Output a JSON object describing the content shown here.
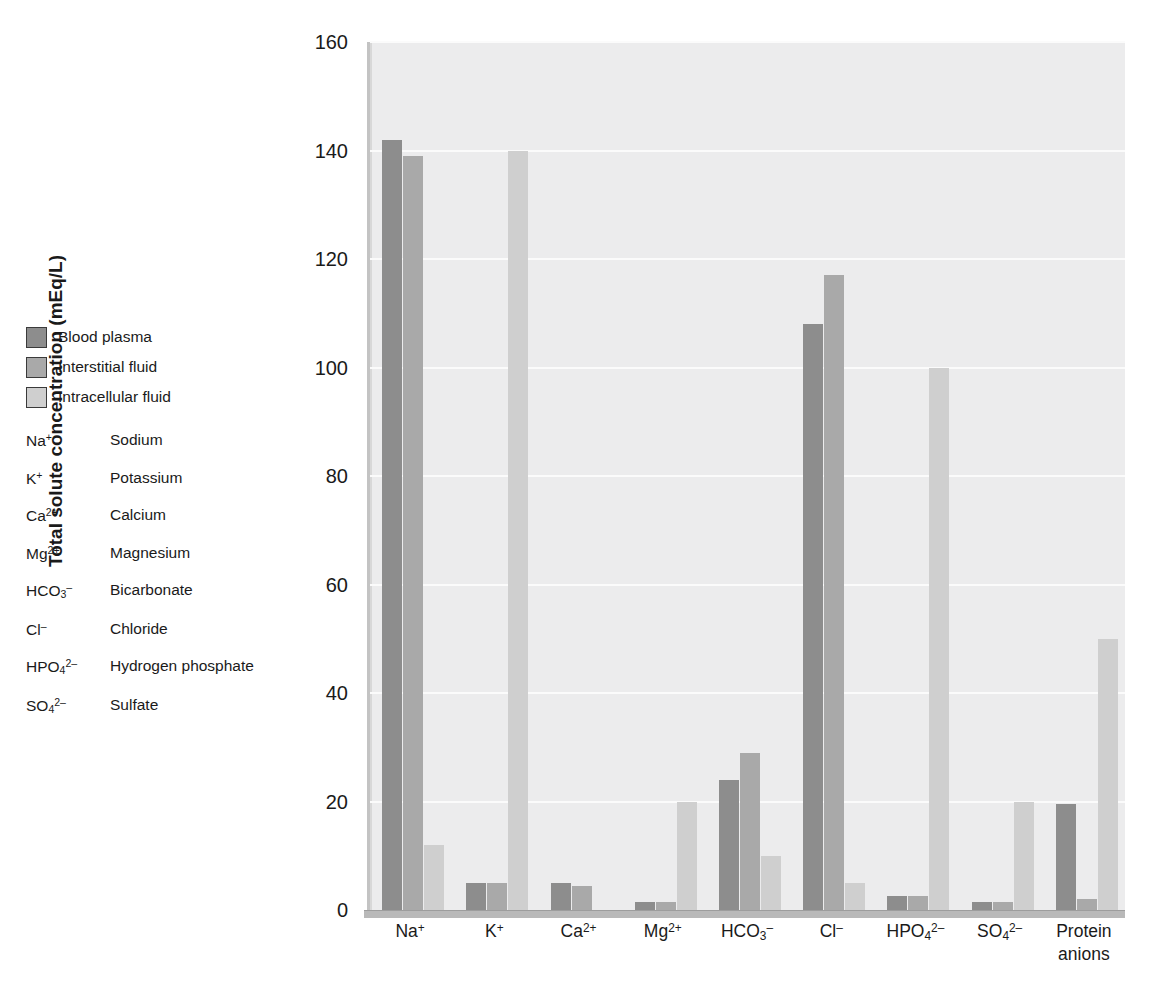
{
  "legend": {
    "items": [
      {
        "label": "Blood plasma",
        "color": "#8d8d8d"
      },
      {
        "label": "Interstitial fluid",
        "color": "#a9a9a9"
      },
      {
        "label": "Intracellular fluid",
        "color": "#cfcfcf"
      }
    ]
  },
  "abbreviations": [
    {
      "symbol_html": "Na<sup>+</sup>",
      "name": "Sodium"
    },
    {
      "symbol_html": "K<sup>+</sup>",
      "name": "Potassium"
    },
    {
      "symbol_html": "Ca<sup>2+</sup>",
      "name": "Calcium"
    },
    {
      "symbol_html": "Mg<sup>2+</sup>",
      "name": "Magnesium"
    },
    {
      "symbol_html": "HCO<sub>3</sub><sup>–</sup>",
      "name": "Bicarbonate"
    },
    {
      "symbol_html": "Cl<sup>–</sup>",
      "name": "Chloride"
    },
    {
      "symbol_html": "HPO<sub>4</sub><sup>2–</sup>",
      "name": "Hydrogen phosphate"
    },
    {
      "symbol_html": "SO<sub>4</sub><sup>2–</sup>",
      "name": "Sulfate"
    }
  ],
  "chart_data": {
    "type": "bar",
    "title": "",
    "xlabel": "",
    "ylabel": "Total solute concentration (mEq/L)",
    "ylim": [
      0,
      160
    ],
    "yticks": [
      0,
      20,
      40,
      60,
      80,
      100,
      120,
      140,
      160
    ],
    "grid": true,
    "legend_position": "left-outside",
    "categories": [
      "Na+",
      "K+",
      "Ca2+",
      "Mg2+",
      "HCO3-",
      "Cl-",
      "HPO4 2-",
      "SO4 2-",
      "Protein anions"
    ],
    "categories_html": [
      "Na<sup>+</sup>",
      "K<sup>+</sup>",
      "Ca<sup>2+</sup>",
      "Mg<sup>2+</sup>",
      "HCO<sub>3</sub><sup>–</sup>",
      "Cl<sup>–</sup>",
      "HPO<sub>4</sub><sup>2–</sup>",
      "SO<sub>4</sub><sup>2–</sup>",
      "Protein<br>anions"
    ],
    "series": [
      {
        "name": "Blood plasma",
        "color": "#8d8d8d",
        "values": [
          142,
          5,
          5,
          1.5,
          24,
          108,
          2.5,
          1.5,
          19.5
        ]
      },
      {
        "name": "Interstitial fluid",
        "color": "#a9a9a9",
        "values": [
          139,
          5,
          4.5,
          1.5,
          29,
          117,
          2.5,
          1.5,
          2
        ]
      },
      {
        "name": "Intracellular fluid",
        "color": "#cfcfcf",
        "values": [
          12,
          140,
          0,
          20,
          10,
          5,
          100,
          20,
          50
        ]
      }
    ]
  }
}
